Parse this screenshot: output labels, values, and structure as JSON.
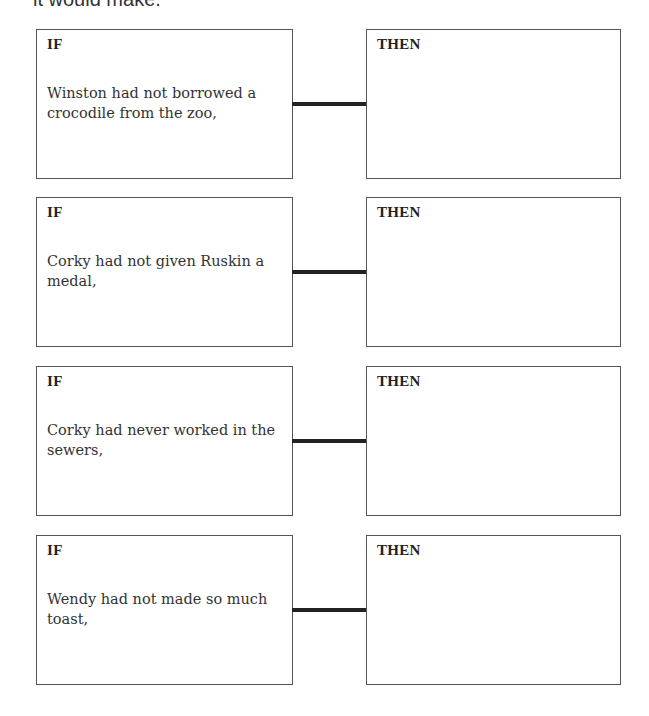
{
  "intro": {
    "text": "it would make."
  },
  "pairs": [
    {
      "if_label": "IF",
      "then_label": "THEN",
      "condition": "Winston had not borrowed a crocodile from the zoo,",
      "answer": ""
    },
    {
      "if_label": "IF",
      "then_label": "THEN",
      "condition": "Corky had not given Ruskin a medal,",
      "answer": ""
    },
    {
      "if_label": "IF",
      "then_label": "THEN",
      "condition": "Corky had never worked in the sewers,",
      "answer": ""
    },
    {
      "if_label": "IF",
      "then_label": "THEN",
      "condition": "Wendy had not made so much toast,",
      "answer": ""
    }
  ],
  "colors": {
    "border": "#555555",
    "connector": "#222222",
    "text": "#333333"
  }
}
